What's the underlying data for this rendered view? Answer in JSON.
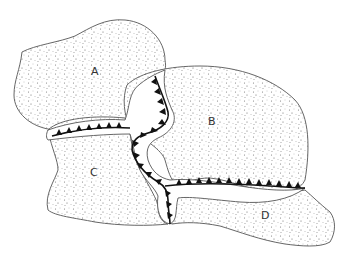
{
  "diagram": {
    "type": "plate-boundary-map",
    "plates": [
      {
        "id": "A",
        "label": "A"
      },
      {
        "id": "B",
        "label": "B"
      },
      {
        "id": "C",
        "label": "C"
      },
      {
        "id": "D",
        "label": "D"
      }
    ],
    "boundary_style": "subduction trench with triangular teeth",
    "colors": {
      "outline": "#555555",
      "trench": "#111111",
      "fill": "#ffffff",
      "stipple": "#777777"
    }
  }
}
